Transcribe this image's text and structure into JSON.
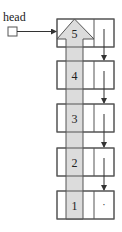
{
  "diagram": {
    "head_label": "head",
    "colors": {
      "stroke": "#555555",
      "fill": "#ffffff",
      "shade": "#dcdcdc",
      "text": "#222222"
    },
    "head_box": {
      "x": 8,
      "y": 27,
      "w": 9,
      "h": 9
    },
    "head_arrow": {
      "x1": 17,
      "y1": 31.5,
      "x2": 56,
      "y2": 31.5
    },
    "node_geometry": {
      "x": 57,
      "w": 57,
      "data_w": 37,
      "h": 28
    },
    "shade_column": {
      "x": 66,
      "w": 17
    },
    "nodes": [
      {
        "value": "5",
        "y": 19,
        "next": "4"
      },
      {
        "value": "4",
        "y": 61,
        "next": "3"
      },
      {
        "value": "3",
        "y": 104,
        "next": "2"
      },
      {
        "value": "2",
        "y": 148,
        "next": "1"
      },
      {
        "value": "1",
        "y": 191,
        "next": null,
        "null_marker": "·"
      }
    ]
  }
}
